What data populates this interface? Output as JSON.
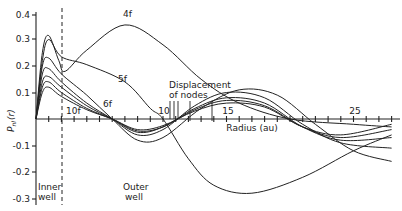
{
  "chart_data": {
    "type": "line",
    "title": "",
    "xlabel": "Radius (au)",
    "ylabel": "P_nl(r)",
    "xlim": [
      0,
      28.5
    ],
    "ylim": [
      -0.31,
      0.42
    ],
    "x_ticks": [
      "10",
      "15",
      "25"
    ],
    "y_ticks": [
      "0.4",
      "0.3",
      "0.2",
      "0.1",
      "-0.1",
      "-0.2",
      "-0.3"
    ],
    "grid": false,
    "legend": null,
    "dashed_line_x": 2.0,
    "annotations": [
      "4f",
      "5f",
      "6f",
      "10f",
      "Displacement of nodes",
      "Inner well",
      "Outer well"
    ],
    "series": [
      {
        "name": "4f",
        "points": [
          [
            0,
            0
          ],
          [
            0.5,
            0.25
          ],
          [
            1,
            0.315
          ],
          [
            1.8,
            0.22
          ],
          [
            2.3,
            0.18
          ],
          [
            4,
            0.26
          ],
          [
            7,
            0.355
          ],
          [
            10,
            0.28
          ],
          [
            13,
            0.15
          ],
          [
            16,
            0.06
          ],
          [
            20,
            0.0
          ],
          [
            25,
            -0.02
          ],
          [
            28,
            -0.03
          ]
        ]
      },
      {
        "name": "5f",
        "points": [
          [
            0,
            0
          ],
          [
            0.5,
            0.22
          ],
          [
            1,
            0.3
          ],
          [
            2,
            0.235
          ],
          [
            4,
            0.205
          ],
          [
            7,
            0.14
          ],
          [
            9,
            0.04
          ],
          [
            10,
            0.0
          ],
          [
            12,
            -0.15
          ],
          [
            14,
            -0.25
          ],
          [
            17,
            -0.28
          ],
          [
            21,
            -0.22
          ],
          [
            25,
            -0.12
          ],
          [
            28,
            -0.06
          ]
        ]
      },
      {
        "name": "6f",
        "points": [
          [
            0,
            0
          ],
          [
            0.5,
            0.2
          ],
          [
            1,
            0.23
          ],
          [
            2,
            0.17
          ],
          [
            4,
            0.09
          ],
          [
            6,
            0.0
          ],
          [
            8,
            -0.08
          ],
          [
            10,
            -0.07
          ],
          [
            13,
            0.04
          ],
          [
            16,
            0.11
          ],
          [
            19,
            0.09
          ],
          [
            22,
            -0.02
          ],
          [
            25,
            -0.12
          ],
          [
            28,
            -0.16
          ]
        ]
      },
      {
        "name": "7f",
        "points": [
          [
            0,
            0
          ],
          [
            0.5,
            0.17
          ],
          [
            1,
            0.19
          ],
          [
            2,
            0.14
          ],
          [
            4,
            0.06
          ],
          [
            6,
            0.0
          ],
          [
            8,
            -0.06
          ],
          [
            10,
            -0.04
          ],
          [
            12.5,
            0.05
          ],
          [
            15,
            0.1
          ],
          [
            18,
            0.08
          ],
          [
            21,
            -0.02
          ],
          [
            24,
            -0.09
          ],
          [
            28,
            -0.11
          ]
        ]
      },
      {
        "name": "8f",
        "points": [
          [
            0,
            0
          ],
          [
            0.5,
            0.14
          ],
          [
            1,
            0.16
          ],
          [
            2,
            0.12
          ],
          [
            4,
            0.05
          ],
          [
            6,
            0.0
          ],
          [
            8,
            -0.05
          ],
          [
            10,
            -0.03
          ],
          [
            12.5,
            0.04
          ],
          [
            15,
            0.08
          ],
          [
            18,
            0.06
          ],
          [
            21,
            -0.03
          ],
          [
            24,
            -0.08
          ],
          [
            28,
            -0.07
          ]
        ]
      },
      {
        "name": "9f",
        "points": [
          [
            0,
            0
          ],
          [
            0.5,
            0.12
          ],
          [
            1,
            0.14
          ],
          [
            2,
            0.1
          ],
          [
            4,
            0.04
          ],
          [
            6,
            0.0
          ],
          [
            8,
            -0.045
          ],
          [
            10,
            -0.03
          ],
          [
            12.5,
            0.035
          ],
          [
            15,
            0.07
          ],
          [
            18,
            0.05
          ],
          [
            21,
            -0.03
          ],
          [
            24,
            -0.07
          ],
          [
            28,
            -0.04
          ]
        ]
      },
      {
        "name": "10f",
        "points": [
          [
            0,
            0
          ],
          [
            0.5,
            0.1
          ],
          [
            1,
            0.12
          ],
          [
            2,
            0.085
          ],
          [
            4,
            0.035
          ],
          [
            6,
            0.0
          ],
          [
            8,
            -0.04
          ],
          [
            10,
            -0.025
          ],
          [
            12.5,
            0.03
          ],
          [
            15,
            0.06
          ],
          [
            18,
            0.045
          ],
          [
            21,
            -0.03
          ],
          [
            24,
            -0.06
          ],
          [
            28,
            -0.02
          ]
        ]
      }
    ]
  },
  "labels": {
    "y_axis_label": "P",
    "y_axis_sub": "nl",
    "y_axis_arg": "(r)",
    "x_axis_label": "Radius (au)",
    "tick_10": "10",
    "tick_15": "15",
    "tick_25": "25",
    "y_04": "0.4",
    "y_03": "0.3",
    "y_02": "0.2",
    "y_01": "0.1",
    "y_m01": "-0.1",
    "y_m02": "-0.2",
    "y_m03": "-0.3",
    "curve_4f": "4f",
    "curve_5f": "5f",
    "curve_6f": "6f",
    "curve_10f": "10f",
    "displacement_line1": "Displacement",
    "displacement_line2": "of nodes",
    "inner_well_1": "Inner",
    "inner_well_2": "well",
    "outer_well_1": "Outer",
    "outer_well_2": "well"
  }
}
